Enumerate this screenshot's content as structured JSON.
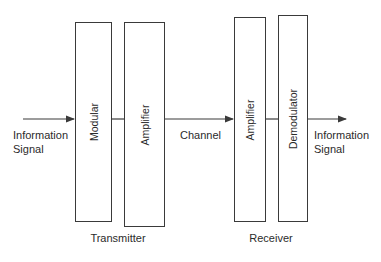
{
  "diagram": {
    "input_label": [
      "Information",
      "Signal"
    ],
    "output_label": [
      "Information",
      "Signal"
    ],
    "channel_label": "Channel",
    "groups": {
      "transmitter": "Transmitter",
      "receiver": "Receiver"
    },
    "blocks": [
      {
        "id": "modular",
        "label": "Modular"
      },
      {
        "id": "tx-amplifier",
        "label": "Amplifier"
      },
      {
        "id": "rx-amplifier",
        "label": "Amplifier"
      },
      {
        "id": "demodulator",
        "label": "Demodulator"
      }
    ],
    "colors": {
      "stroke": "#3a3a3a",
      "text": "#2b2b2b",
      "background": "#ffffff"
    }
  }
}
